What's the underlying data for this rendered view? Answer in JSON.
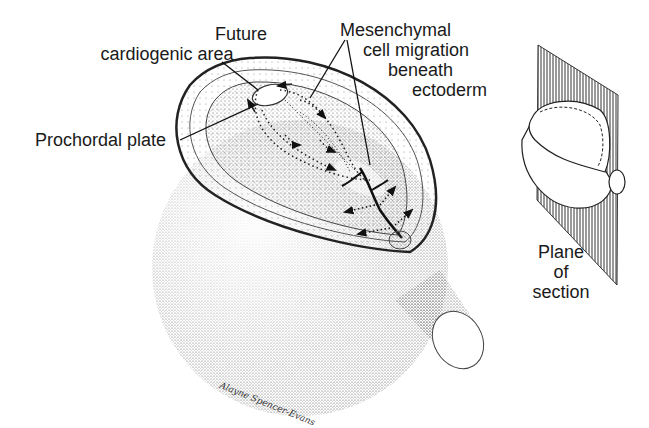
{
  "figure": {
    "labels": {
      "future_cardiogenic_area": [
        "Future",
        "cardiogenic area"
      ],
      "prochordal_plate": "Prochordal plate",
      "mesenchymal_migration": [
        "Mesenchymal",
        "cell migration",
        "beneath",
        "ectoderm"
      ],
      "plane_of_section": [
        "Plane",
        "of",
        "section"
      ]
    },
    "signature": "Alayne Spencer-Evans",
    "colors": {
      "ink": "#1a1a1a",
      "stipple": "#555555",
      "background": "#ffffff"
    }
  }
}
